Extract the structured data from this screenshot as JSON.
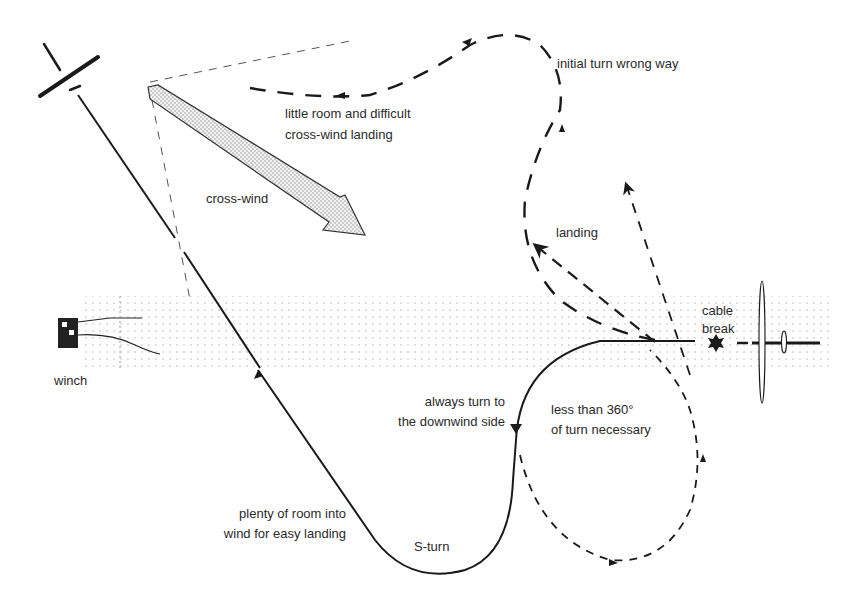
{
  "diagram": {
    "labels": {
      "initial_turn": "initial turn wrong way",
      "little_room_1": "little room and difficult",
      "little_room_2": "cross-wind landing",
      "cross_wind": "cross-wind",
      "landing": "landing",
      "cable_break_1": "cable",
      "cable_break_2": "break",
      "winch": "winch",
      "always_turn_1": "always turn to",
      "always_turn_2": "the downwind side",
      "less_than_1": "less than 360°",
      "less_than_2": "of turn necessary",
      "plenty_1": "plenty of room into",
      "plenty_2": "wind for easy landing",
      "s_turn": "S-turn"
    },
    "colors": {
      "ink": "#1a1a1a",
      "dots": "#bdbdbd",
      "arrow_fill": "#e6e6e6"
    },
    "icons": [
      "glider-icon",
      "winch-icon",
      "cable-break-star-icon",
      "wind-arrow-icon"
    ]
  }
}
